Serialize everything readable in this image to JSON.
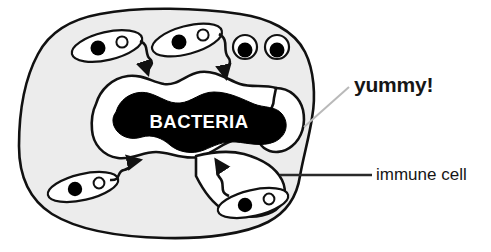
{
  "figure": {
    "title_text": "BACTERIA",
    "cell_fill": "#ececec",
    "outline_color": "#111111",
    "blob_fill": "#000000",
    "vacuole_fill": "#ffffff",
    "background": "#ffffff",
    "parts": {
      "immune_cell": "immune-cell-body",
      "phagosome": "vacuole-region",
      "bacteria_mass": "engulfed-bacteria-blob",
      "eyes": 2,
      "rod_bacteria": 4,
      "arrows": 4
    }
  },
  "labels": {
    "yummy": "yummy!",
    "immune_cell": "immune cell"
  },
  "leaders": {
    "yummy_leader_color": "#b9b9b9",
    "immune_leader_color": "#2a2a2a"
  }
}
